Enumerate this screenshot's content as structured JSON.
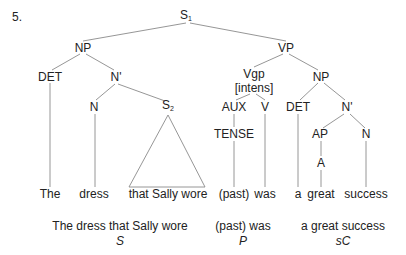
{
  "example_number": "5.",
  "colors": {
    "line": "#8a8a8a",
    "text": "#222222",
    "background": "#ffffff"
  },
  "tree": {
    "root": {
      "label": "S",
      "subscript": "1"
    },
    "np_subject": "NP",
    "vp": "VP",
    "det_subject": "DET",
    "nbar_subject": "N'",
    "n_subject": "N",
    "s_embedded": {
      "label": "S",
      "subscript": "2"
    },
    "vgp": "Vgp",
    "vgp_feature": "[intens]",
    "aux": "AUX",
    "tense": "TENSE",
    "v": "V",
    "np_complement": "NP",
    "det_complement": "DET",
    "nbar_complement": "N'",
    "ap": "AP",
    "a": "A",
    "n_complement": "N"
  },
  "leaves": {
    "the": "The",
    "dress": "dress",
    "relative_clause": "that Sally wore",
    "past": "(past)",
    "was": "was",
    "a": "a",
    "great": "great",
    "success": "success"
  },
  "functions": [
    {
      "phrase": "The dress that Sally wore",
      "role": "S"
    },
    {
      "phrase": "(past) was",
      "role": "P"
    },
    {
      "phrase": "a great success",
      "role": "sC"
    }
  ]
}
